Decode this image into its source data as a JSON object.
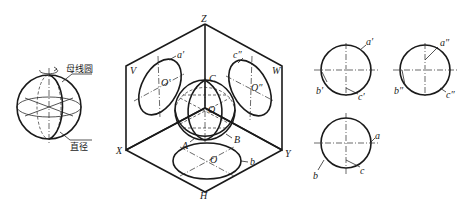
{
  "figure": {
    "left": {
      "label_generatrix": "母线圆",
      "label_diameter": "直径"
    },
    "box": {
      "axis_z": "Z",
      "axis_x": "X",
      "axis_y": "Y",
      "plane_v": "V",
      "plane_w": "W",
      "plane_h": "H",
      "pt_a1": "a′",
      "pt_c2": "c″",
      "center_o1": "O′",
      "center_o2": "O″",
      "pt_C": "C",
      "pt_A": "A",
      "pt_B": "B",
      "center_O_sphere": "O",
      "center_O_h": "O",
      "pt_b": "b"
    },
    "views": {
      "front": {
        "a": "a′",
        "b": "b′",
        "c": "c′"
      },
      "side": {
        "a": "a″",
        "b": "b″",
        "c": "c″"
      },
      "top": {
        "a": "a",
        "b": "b",
        "c": "c"
      }
    }
  }
}
